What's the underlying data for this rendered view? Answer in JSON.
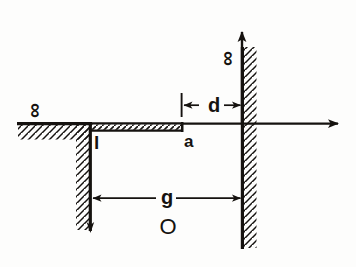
{
  "figure": {
    "title": "",
    "kind": "engineering-sketch",
    "ink_color": "#15120f",
    "background_color": "#fdfdfc"
  },
  "labels": {
    "infinity_left": "∞",
    "infinity_right": "∞",
    "dim_d": "d",
    "dim_g": "g",
    "label_a": "a",
    "label_l": "l",
    "label_O": "O"
  },
  "geometry": {
    "axes": {
      "horizontal_axis_y": 123,
      "horizontal_axis_x_end": 348,
      "vertical_axis_x": 242,
      "vertical_axis_y_top": 24
    },
    "left_ground": {
      "x_start": 18,
      "x_end": 90,
      "y": 123,
      "hatch_side": "below"
    },
    "left_wall": {
      "x": 90,
      "y_top": 124,
      "y_bottom": 231,
      "hatch_side": "left"
    },
    "plate": {
      "x_start": 90,
      "x_end": 183,
      "y_top": 123,
      "y_bottom": 131,
      "hatch": true
    },
    "right_wall": {
      "x": 242,
      "y_top": 47,
      "y_bottom": 248,
      "hatch_side": "right"
    },
    "dim_d": {
      "y": 105,
      "x_left": 182,
      "x_right": 242
    },
    "dim_g": {
      "y": 198,
      "x_left": 92,
      "x_right": 242
    }
  },
  "annotations": {
    "a_note": "right edge of the horizontal plate",
    "l_note": "plate thickness / depth tick below plate corner",
    "O_note": "origin region marker below the gap",
    "d_note": "distance from plate edge to vertical wall",
    "g_note": "gap width between the two vertical walls"
  }
}
